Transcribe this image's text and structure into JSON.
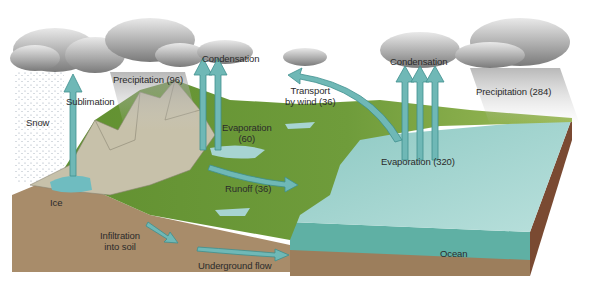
{
  "diagram": {
    "labels": {
      "snow": "Snow",
      "sublimation": "Sublimation",
      "precipitation_land": "Precipitation (96)",
      "condensation_land": "Condensation",
      "transport_line1": "Transport",
      "transport_line2": "by wind (36)",
      "condensation_ocean": "Condensation",
      "precipitation_ocean": "Precipitation (284)",
      "evaporation_land_line1": "Evaporation",
      "evaporation_land_line2": "(60)",
      "evaporation_ocean": "Evaporation (320)",
      "ice": "Ice",
      "runoff": "Runoff (36)",
      "infiltration_line1": "Infiltration",
      "infiltration_line2": "into soil",
      "underground_flow": "Underground flow",
      "ocean": "Ocean"
    },
    "flows": [
      {
        "name": "Precipitation over land",
        "value": 96
      },
      {
        "name": "Evaporation from land",
        "value": 60
      },
      {
        "name": "Transport by wind",
        "value": 36
      },
      {
        "name": "Runoff",
        "value": 36
      },
      {
        "name": "Evaporation from ocean",
        "value": 320
      },
      {
        "name": "Precipitation over ocean",
        "value": 284
      }
    ],
    "colors": {
      "arrow": "#6fb8b6",
      "arrow_edge": "#3f8f8e",
      "ocean_top": "#9fd0cc",
      "ocean_side": "#63b3a8",
      "soil": "#a58a6a",
      "land_green": "#6e9a3a",
      "mountain": "#c9c3ae",
      "cloud": "#9a9a9a"
    }
  }
}
